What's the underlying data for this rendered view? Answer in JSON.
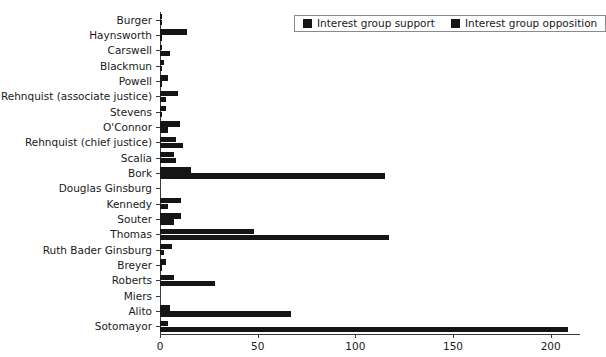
{
  "chart_data": {
    "type": "bar",
    "orientation": "horizontal",
    "title": "",
    "xlabel": "",
    "ylabel": "",
    "xlim": [
      0,
      215
    ],
    "ylim": null,
    "grid": false,
    "legend_position": "top-right",
    "xticks": [
      0,
      50,
      100,
      150,
      200
    ],
    "xtick_labels": [
      "0",
      "50",
      "100",
      "150",
      "200"
    ],
    "categories": [
      "Burger",
      "Haynsworth",
      "Carswell",
      "Blackmun",
      "Powell",
      "Rehnquist (associate justice)",
      "Stevens",
      "O'Connor",
      "Rehnquist (chief justice)",
      "Scalia",
      "Bork",
      "Douglas Ginsburg",
      "Kennedy",
      "Souter",
      "Thomas",
      "Ruth Bader Ginsburg",
      "Breyer",
      "Roberts",
      "Miers",
      "Alito",
      "Sotomayor"
    ],
    "series": [
      {
        "name": "Interest group support",
        "color": "#151515",
        "values": [
          1,
          14,
          1,
          2,
          4,
          9,
          3,
          10,
          8,
          7,
          16,
          0,
          11,
          11,
          48,
          6,
          3,
          7,
          0,
          5,
          4
        ]
      },
      {
        "name": "Interest group opposition",
        "color": "#151515",
        "values": [
          1,
          1,
          5,
          1,
          1,
          3,
          1,
          4,
          12,
          8,
          115,
          0,
          4,
          7,
          117,
          2,
          1,
          28,
          0,
          67,
          209
        ]
      }
    ]
  },
  "legend": {
    "items": [
      {
        "label": "Interest group support"
      },
      {
        "label": "Interest group opposition"
      }
    ]
  }
}
